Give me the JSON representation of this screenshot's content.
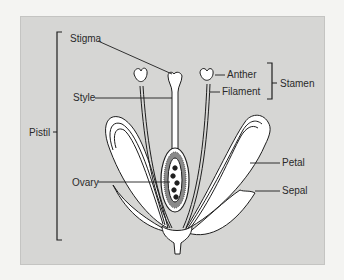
{
  "diagram": {
    "colors": {
      "panel": "#d6d6d4",
      "outline": "#1e1e1e",
      "fill": "#ffffff",
      "text": "#2a2a2a"
    },
    "labels": {
      "stigma": "Stigma",
      "style": "Style",
      "pistil": "Pistil",
      "ovary": "Ovary",
      "anther": "Anther",
      "filament": "Filament",
      "stamen": "Stamen",
      "petal": "Petal",
      "sepal": "Sepal"
    },
    "groups": [
      {
        "name": "Pistil",
        "parts": [
          "Stigma",
          "Style",
          "Ovary"
        ]
      },
      {
        "name": "Stamen",
        "parts": [
          "Anther",
          "Filament"
        ]
      }
    ]
  }
}
